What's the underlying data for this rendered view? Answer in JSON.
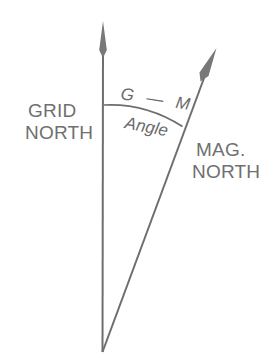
{
  "figure": {
    "background_color": "#ffffff",
    "line_color": "#6e6e6e",
    "text_color": "#6f6f6f"
  },
  "labels": {
    "grid_north_line1": "GRID",
    "grid_north_line2": "NORTH",
    "mag_north_line1": "MAG.",
    "mag_north_line2": "NORTH",
    "angle_line1": "G — M",
    "angle_line2": "Angle"
  },
  "geometry": {
    "vertex": {
      "x": 102,
      "y": 352
    },
    "grid_arrow_tip": {
      "x": 103,
      "y": 22
    },
    "mag_arrow_tip": {
      "x": 216,
      "y": 49
    },
    "arc_start": {
      "x": 104,
      "y": 105
    },
    "arc_end": {
      "x": 182,
      "y": 126
    }
  }
}
